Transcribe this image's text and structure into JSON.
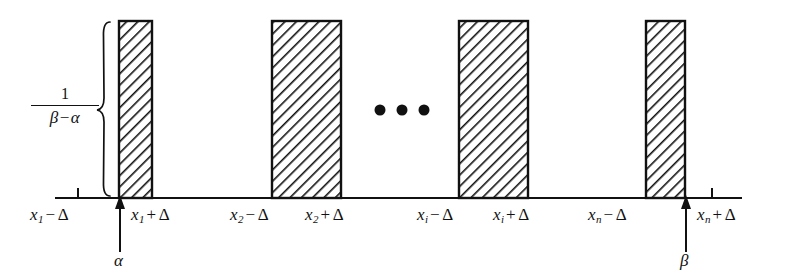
{
  "figure": {
    "background_color": "#ffffff",
    "ink_color": "#111111",
    "density_label": {
      "numerator": "1",
      "denominator_left": "β",
      "denominator_op": "−",
      "denominator_right": "α"
    },
    "axis": {
      "x_start": 55,
      "x_end": 742,
      "y": 198,
      "ticks": [
        78,
        712
      ]
    },
    "bars": [
      {
        "id": "bar-1",
        "x": 119,
        "width": 33,
        "top": 21,
        "bottom": 198
      },
      {
        "id": "bar-2",
        "x": 272,
        "width": 69,
        "top": 21,
        "bottom": 198
      },
      {
        "id": "bar-3",
        "x": 459,
        "width": 69,
        "top": 21,
        "bottom": 198
      },
      {
        "id": "bar-4",
        "x": 646,
        "width": 39,
        "top": 21,
        "bottom": 198
      }
    ],
    "ellipsis": {
      "dots": 3,
      "x_positions": [
        380,
        402,
        424
      ],
      "y": 110
    },
    "brace": {
      "x": 104,
      "top": 22,
      "bottom": 196
    },
    "arrows": [
      {
        "id": "alpha-arrow",
        "x": 120,
        "tip_y": 198,
        "tail_y": 252,
        "label": "α",
        "label_x": 114,
        "label_y": 252
      },
      {
        "id": "beta-arrow",
        "x": 686,
        "tip_y": 198,
        "tail_y": 252,
        "label": "β",
        "label_x": 680,
        "label_y": 252
      }
    ],
    "axis_labels": [
      {
        "id": "label-x1-minus",
        "var": "x",
        "sub": "1",
        "op": "−",
        "delta": "Δ",
        "x": 30,
        "y": 205
      },
      {
        "id": "label-x1-plus",
        "var": "x",
        "sub": "1",
        "op": "+",
        "delta": "Δ",
        "x": 131,
        "y": 205
      },
      {
        "id": "label-x2-minus",
        "var": "x",
        "sub": "2",
        "op": "−",
        "delta": "Δ",
        "x": 230,
        "y": 205
      },
      {
        "id": "label-x2-plus",
        "var": "x",
        "sub": "2",
        "op": "+",
        "delta": "Δ",
        "x": 305,
        "y": 205
      },
      {
        "id": "label-xi-minus",
        "var": "x",
        "sub": "i",
        "op": "−",
        "delta": "Δ",
        "x": 417,
        "y": 205
      },
      {
        "id": "label-xi-plus",
        "var": "x",
        "sub": "i",
        "op": "+",
        "delta": "Δ",
        "x": 493,
        "y": 205
      },
      {
        "id": "label-xn-minus",
        "var": "x",
        "sub": "n",
        "op": "−",
        "delta": "Δ",
        "x": 588,
        "y": 205
      },
      {
        "id": "label-xn-plus",
        "var": "x",
        "sub": "n",
        "op": "+",
        "delta": "Δ",
        "x": 697,
        "y": 205
      }
    ]
  }
}
